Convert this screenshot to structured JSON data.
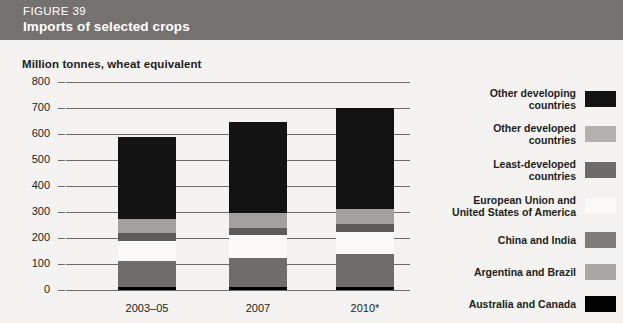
{
  "header": {
    "figure_number": "FIGURE 39",
    "title": "Imports of selected crops",
    "background_color": "#74716f"
  },
  "chart_data": {
    "type": "bar",
    "stacked": true,
    "title": "Imports of selected crops",
    "subtitle": "FIGURE 39",
    "xlabel": "",
    "ylabel": "Million tonnes, wheat equivalent",
    "ylim": [
      0,
      800
    ],
    "ytick_step": 100,
    "yticks": [
      "800",
      "700",
      "600",
      "500",
      "400",
      "300",
      "200",
      "100",
      "0"
    ],
    "grid": true,
    "legend_position": "right",
    "categories": [
      "2003–05",
      "2007",
      "2010*"
    ],
    "series": [
      {
        "name": "Australia and Canada",
        "color": "#000000",
        "values": [
          110,
          125,
          140
        ]
      },
      {
        "name": "Argentina and Brazil",
        "color": "#b9b7b3",
        "values": [
          80,
          85,
          85
        ]
      },
      {
        "name": "China and India",
        "color": "#787572",
        "values": [
          30,
          30,
          30
        ]
      },
      {
        "name": "European Union and\nUnited States of America",
        "color": "#fbfaf8",
        "values": [
          55,
          55,
          55
        ]
      },
      {
        "name": "Least-developed\ncountries",
        "color": "#5d5a57",
        "values": [
          0,
          0,
          0
        ]
      },
      {
        "name": "Other developed\ncountries",
        "color": "#a8a5a2",
        "values": [
          0,
          0,
          0
        ]
      },
      {
        "name": "Other developing\ncountries",
        "color": "#141313",
        "values": [
          315,
          350,
          390
        ]
      }
    ],
    "totals": [
      590,
      645,
      700
    ]
  },
  "axis": {
    "title": "Million tonnes, wheat equivalent",
    "y_labels": [
      "800",
      "700",
      "600",
      "500",
      "400",
      "300",
      "200",
      "100",
      "0"
    ],
    "x_labels": [
      "2003–05",
      "2007",
      "2010*"
    ]
  },
  "legend": {
    "items": [
      {
        "label": "Other developing\ncountries",
        "color": "#141313"
      },
      {
        "label": "Other developed\ncountries",
        "color": "#b3b0ad"
      },
      {
        "label": "Least-developed\ncountries",
        "color": "#6e6b68"
      },
      {
        "label": "European Union and\nUnited States of America",
        "color": "#fbfaf8"
      },
      {
        "label": "China and India",
        "color": "#7e7b78"
      },
      {
        "label": "Argentina and Brazil",
        "color": "#a9a6a3"
      },
      {
        "label": "Australia and Canada",
        "color": "#000000"
      }
    ]
  },
  "bars": [
    {
      "category": "2003–05",
      "total": 590,
      "segments": [
        {
          "name": "Australia and Canada",
          "value": 110,
          "color": "#6f6c69"
        },
        {
          "name": "Argentina and Brazil",
          "value": 80,
          "color": "#fbfaf8"
        },
        {
          "name": "China and India",
          "value": 30,
          "color": "#5d5a57"
        },
        {
          "name": "Other developed",
          "value": 55,
          "color": "#a3a09d"
        },
        {
          "name": "Other developing",
          "value": 315,
          "color": "#141313"
        }
      ]
    },
    {
      "category": "2007",
      "total": 645,
      "segments": [
        {
          "name": "Australia and Canada",
          "value": 125,
          "color": "#6f6c69"
        },
        {
          "name": "Argentina and Brazil",
          "value": 85,
          "color": "#fbfaf8"
        },
        {
          "name": "China and India",
          "value": 30,
          "color": "#5d5a57"
        },
        {
          "name": "Other developed",
          "value": 55,
          "color": "#a3a09d"
        },
        {
          "name": "Other developing",
          "value": 350,
          "color": "#141313"
        }
      ]
    },
    {
      "category": "2010*",
      "total": 700,
      "segments": [
        {
          "name": "Australia and Canada",
          "value": 140,
          "color": "#6f6c69"
        },
        {
          "name": "Argentina and Brazil",
          "value": 85,
          "color": "#fbfaf8"
        },
        {
          "name": "China and India",
          "value": 30,
          "color": "#5d5a57"
        },
        {
          "name": "Other developed",
          "value": 55,
          "color": "#a3a09d"
        },
        {
          "name": "Other developing",
          "value": 390,
          "color": "#141313"
        }
      ]
    }
  ]
}
